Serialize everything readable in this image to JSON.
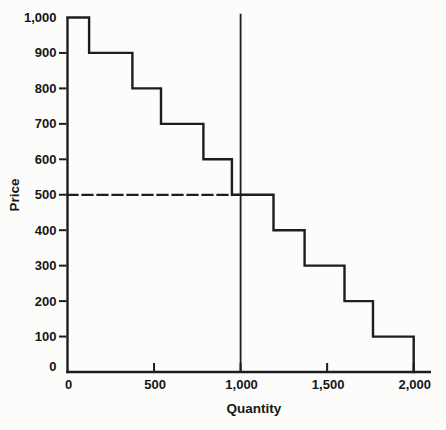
{
  "page": {
    "background": "#fcfcfb",
    "ink": "#1d1d1d"
  },
  "chart_data": {
    "type": "line",
    "subtype": "step-function-demand-with-vertical-supply-line",
    "title": "",
    "xlabel": "Quantity",
    "ylabel": "Price",
    "xlim": [
      0,
      2100
    ],
    "ylim": [
      0,
      1000
    ],
    "grid": false,
    "legend": false,
    "x_axis": {
      "ticks": [
        {
          "value": 0,
          "label": "0",
          "mark": false
        },
        {
          "value": 500,
          "label": "500",
          "mark": true
        },
        {
          "value": 1000,
          "label": "1,000",
          "mark": true
        },
        {
          "value": 1500,
          "label": "1,500",
          "mark": true
        },
        {
          "value": 2000,
          "label": "2,000",
          "mark": true
        }
      ]
    },
    "y_axis": {
      "ticks": [
        {
          "value": 0,
          "label": "0",
          "mark": false
        },
        {
          "value": 100,
          "label": "100",
          "mark": true
        },
        {
          "value": 200,
          "label": "200",
          "mark": true
        },
        {
          "value": 300,
          "label": "300",
          "mark": true
        },
        {
          "value": 400,
          "label": "400",
          "mark": true
        },
        {
          "value": 500,
          "label": "500",
          "mark": true
        },
        {
          "value": 600,
          "label": "600",
          "mark": true
        },
        {
          "value": 700,
          "label": "700",
          "mark": true
        },
        {
          "value": 800,
          "label": "800",
          "mark": true
        },
        {
          "value": 900,
          "label": "900",
          "mark": true
        },
        {
          "value": 1000,
          "label": "1,000",
          "mark": false
        }
      ]
    },
    "series": [
      {
        "name": "staircase-demand-curve",
        "style": "solid",
        "points": [
          [
            0,
            1000
          ],
          [
            125,
            1000
          ],
          [
            125,
            900
          ],
          [
            375,
            900
          ],
          [
            375,
            800
          ],
          [
            540,
            800
          ],
          [
            540,
            700
          ],
          [
            785,
            700
          ],
          [
            785,
            600
          ],
          [
            950,
            600
          ],
          [
            950,
            500
          ],
          [
            1190,
            500
          ],
          [
            1190,
            400
          ],
          [
            1370,
            400
          ],
          [
            1370,
            300
          ],
          [
            1600,
            300
          ],
          [
            1600,
            200
          ],
          [
            1765,
            200
          ],
          [
            1765,
            100
          ],
          [
            2000,
            100
          ],
          [
            2000,
            0
          ]
        ]
      },
      {
        "name": "vertical-supply-line",
        "style": "solid",
        "points": [
          [
            1000,
            0
          ],
          [
            1000,
            1008
          ]
        ]
      },
      {
        "name": "equilibrium-price-dashed-guide",
        "style": "dashed",
        "points": [
          [
            0,
            500
          ],
          [
            950,
            500
          ]
        ]
      }
    ]
  }
}
